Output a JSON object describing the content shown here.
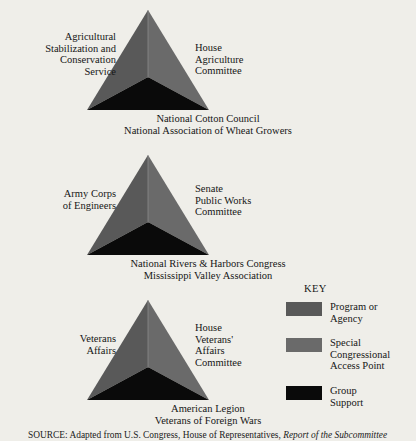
{
  "figure": {
    "background_color": "#efeee9",
    "colors": {
      "program_agency": "#595959",
      "special_access": "#6a6a6a",
      "group_support": "#0a0a0a"
    },
    "triangles": [
      {
        "id": "agriculture",
        "left_label": "Agricultural\nStabilization and\nConservation\nService",
        "right_label": "House\nAgriculture\nCommittee",
        "bottom_label": "National Cotton Council\nNational Association of Wheat Growers"
      },
      {
        "id": "public-works",
        "left_label": "Army Corps\nof Engineers",
        "right_label": "Senate\nPublic Works\nCommittee",
        "bottom_label": "National Rivers & Harbors Congress\nMississippi Valley Association"
      },
      {
        "id": "veterans",
        "left_label": "Veterans\nAffairs",
        "right_label": "House\nVeterans'\nAffairs\nCommittee",
        "bottom_label": "American Legion\nVeterans of Foreign Wars"
      }
    ]
  },
  "key": {
    "title": "KEY",
    "items": [
      {
        "label": "Program or\nAgency",
        "color": "#595959"
      },
      {
        "label": "Special\nCongressional\nAccess Point",
        "color": "#6a6a6a"
      },
      {
        "label": "Group\nSupport",
        "color": "#0a0a0a"
      }
    ]
  },
  "source": {
    "prefix": "SOURCE",
    "text": ": Adapted from U.S. Congress, House of Representatives, ",
    "italic": "Report of the Subcommittee"
  }
}
